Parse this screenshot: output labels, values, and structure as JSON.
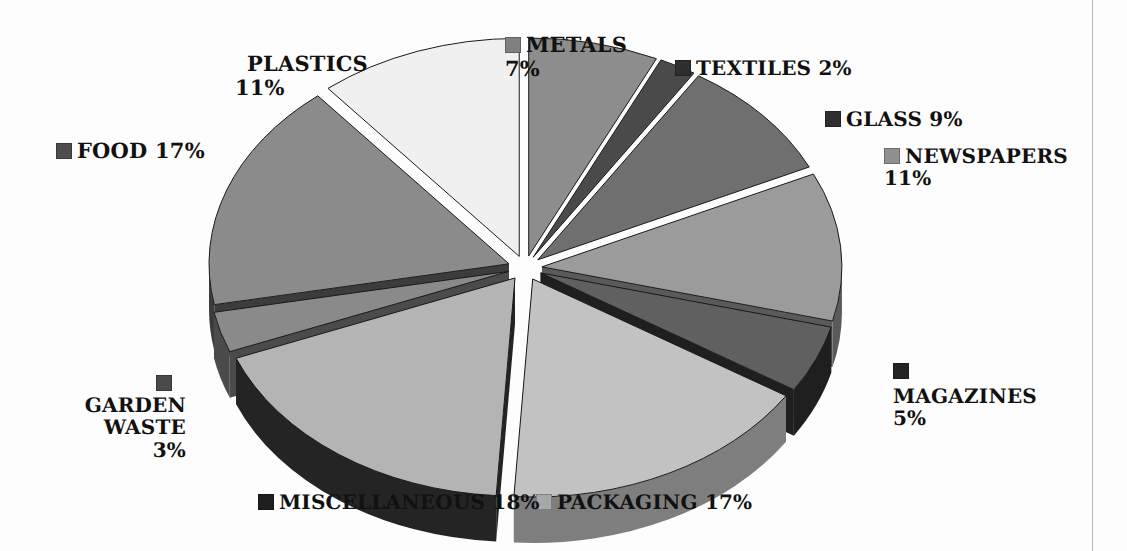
{
  "chart_data": {
    "type": "pie",
    "title": "",
    "subtitle": "",
    "xlabel": "",
    "ylabel": "",
    "legend_position": "around-slices",
    "grid": false,
    "style": "3d-exploded-grayscale",
    "unit": "%",
    "total": 100,
    "categories": [
      "METALS",
      "TEXTILES",
      "GLASS",
      "NEWSPAPERS",
      "MAGAZINES",
      "PACKAGING",
      "MISCELLANEOUS",
      "GARDEN WASTE",
      "FOOD",
      "PLASTICS"
    ],
    "values": [
      7,
      2,
      9,
      11,
      5,
      17,
      18,
      3,
      17,
      11
    ],
    "slices": [
      {
        "name": "METALS",
        "label": "METALS",
        "percent": 7,
        "percent_text": "7%",
        "color": "#8d8d8d",
        "side_color": "#5d5d5d",
        "swatch": "#808080",
        "exploded": true
      },
      {
        "name": "TEXTILES",
        "label": "TEXTILES",
        "percent": 2,
        "percent_text": "2%",
        "color": "#4a4a4a",
        "side_color": "#2a2a2a",
        "swatch": "#2e2e2e",
        "exploded": true
      },
      {
        "name": "GLASS",
        "label": "GLASS",
        "percent": 9,
        "percent_text": "9%",
        "color": "#6f6f6f",
        "side_color": "#474747",
        "swatch": "#2f2f2f",
        "exploded": true
      },
      {
        "name": "NEWSPAPERS",
        "label": "NEWSPAPERS",
        "percent": 11,
        "percent_text": "11%",
        "color": "#9b9b9b",
        "side_color": "#5a5a5a",
        "swatch": "#8f8f8f",
        "exploded": true
      },
      {
        "name": "MAGAZINES",
        "label": "MAGAZINES",
        "percent": 5,
        "percent_text": "5%",
        "color": "#606060",
        "side_color": "#1f1f1f",
        "swatch": "#242424",
        "exploded": true
      },
      {
        "name": "PACKAGING",
        "label": "PACKAGING",
        "percent": 17,
        "percent_text": "17%",
        "color": "#c2c2c2",
        "side_color": "#7e7e7e",
        "swatch": "#a8a8a8",
        "exploded": true
      },
      {
        "name": "MISCELLANEOUS",
        "label": "MISCELLANEOUS",
        "percent": 18,
        "percent_text": "18%",
        "color": "#b4b4b4",
        "side_color": "#242424",
        "swatch": "#1e1e1e",
        "exploded": true
      },
      {
        "name": "GARDEN WASTE",
        "label": "GARDEN WASTE",
        "percent": 3,
        "percent_text": "3%",
        "color": "#8a8a8a",
        "side_color": "#4b4b4b",
        "swatch": "#4a4a4a",
        "exploded": true
      },
      {
        "name": "FOOD",
        "label": "FOOD",
        "percent": 17,
        "percent_text": "17%",
        "color": "#8b8b8b",
        "side_color": "#3c3c3c",
        "swatch": "#4d4d4d",
        "exploded": true
      },
      {
        "name": "PLASTICS",
        "label": "PLASTICS",
        "percent": 11,
        "percent_text": "11%",
        "color": "#f0f0f0",
        "side_color": "#bdbdbd",
        "swatch": "#f2f2f2",
        "exploded": true
      }
    ]
  },
  "labels": {
    "metals": {
      "name": "METALS",
      "pct": "7%"
    },
    "textiles": {
      "name": "TEXTILES",
      "pct": "2%"
    },
    "glass": {
      "name": "GLASS",
      "pct": "9%"
    },
    "newspapers": {
      "name": "NEWSPAPERS",
      "pct": "11%"
    },
    "magazines": {
      "name": "MAGAZINES",
      "pct": "5%"
    },
    "packaging": {
      "name": "PACKAGING",
      "pct": "17%"
    },
    "miscellaneous": {
      "name": "MISCELLANEOUS",
      "pct": "18%"
    },
    "garden_line1": "GARDEN",
    "garden_line2": "WASTE",
    "garden_pct": "3%",
    "food": {
      "name": "FOOD",
      "pct": "17%"
    },
    "plastics": {
      "name": "PLASTICS",
      "pct": "11%"
    }
  }
}
